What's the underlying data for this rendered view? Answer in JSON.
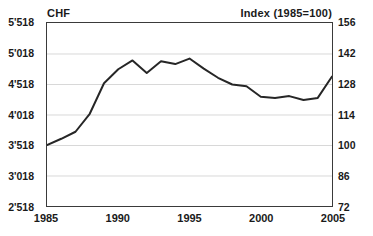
{
  "header": {
    "left_axis_title": "CHF",
    "right_axis_title": "Index (1985=100)"
  },
  "chart_data": {
    "type": "line",
    "title": "",
    "subtitle": "",
    "xlabel": "",
    "ylabel": "CHF",
    "y2label": "Index (1985=100)",
    "grid": true,
    "legend": null,
    "legend_position": "none",
    "xlim": [
      1985,
      2005
    ],
    "ylim": [
      2518,
      5518
    ],
    "y2lim": [
      72,
      156
    ],
    "xticks": [
      1985,
      1990,
      1995,
      2000,
      2005
    ],
    "xtick_labels": [
      "1985",
      "1990",
      "1995",
      "2000",
      "2005"
    ],
    "yticks": [
      2518,
      3018,
      3518,
      4018,
      4518,
      5018,
      5518
    ],
    "ytick_labels": [
      "2'518",
      "3'018",
      "3'518",
      "4'018",
      "4'518",
      "5'018",
      "5'518"
    ],
    "y2ticks": [
      72,
      86,
      100,
      114,
      128,
      142,
      156
    ],
    "y2tick_labels": [
      "72",
      "86",
      "100",
      "114",
      "128",
      "142",
      "156"
    ],
    "x": [
      1985,
      1986,
      1987,
      1988,
      1989,
      1990,
      1991,
      1992,
      1993,
      1994,
      1995,
      1996,
      1997,
      1998,
      1999,
      2000,
      2001,
      2002,
      2003,
      2004,
      2005
    ],
    "series": [
      {
        "name": "CHF",
        "color": "#262626",
        "values": [
          3518,
          3620,
          3735,
          4030,
          4530,
          4760,
          4905,
          4700,
          4890,
          4845,
          4935,
          4770,
          4620,
          4510,
          4480,
          4310,
          4290,
          4320,
          4255,
          4290,
          4640
        ]
      }
    ],
    "index_values": [
      100,
      102.9,
      106.1,
      114.4,
      128.5,
      135.0,
      139.1,
      133.3,
      138.7,
      137.5,
      140.0,
      135.3,
      131.1,
      128.0,
      127.1,
      122.3,
      121.7,
      122.6,
      120.8,
      121.7,
      131.6
    ]
  }
}
